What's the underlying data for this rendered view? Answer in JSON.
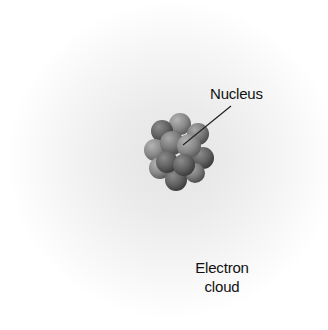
{
  "diagram": {
    "type": "atom-model",
    "labels": {
      "nucleus": "Nucleus",
      "electron_cloud_line1": "Electron",
      "electron_cloud_line2": "cloud"
    },
    "colors": {
      "background": "#ffffff",
      "cloud": "#e4e4e4",
      "particle_dark": "#5c5c5c",
      "particle_light": "#9a9a9a",
      "text": "#111111"
    }
  }
}
